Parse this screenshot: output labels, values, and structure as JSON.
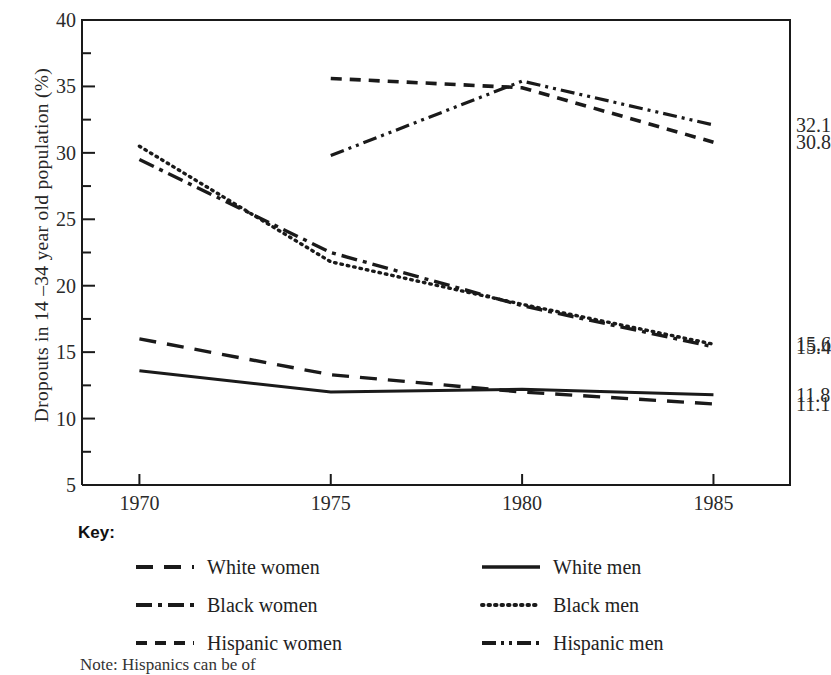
{
  "figure": {
    "ylabel": "Dropouts in 14 –34 year old population (%)",
    "key_title": "Key:",
    "footnote": "Note: Hispanics can be of"
  },
  "chart_data": {
    "type": "line",
    "title": "",
    "xlabel": "",
    "ylabel": "Dropouts in 14 –34 year old population (%)",
    "x": [
      1970,
      1975,
      1980,
      1985
    ],
    "xlim": [
      1968.5,
      1987.0
    ],
    "ylim": [
      5,
      40
    ],
    "xticks": [
      "1970",
      "1975",
      "1980",
      "1985"
    ],
    "yticks": [
      "5",
      "10",
      "15",
      "20",
      "25",
      "30",
      "35",
      "40"
    ],
    "y_minor_step": 2.5,
    "grid": false,
    "legend_position": "below-plot",
    "series": [
      {
        "name": "White women",
        "style": "dashed",
        "x": [
          1970,
          1975,
          1980,
          1985
        ],
        "values": [
          16.0,
          13.3,
          12.0,
          11.1
        ],
        "end_label": "11.1"
      },
      {
        "name": "White men",
        "style": "solid",
        "x": [
          1970,
          1975,
          1980,
          1985
        ],
        "values": [
          13.6,
          12.0,
          12.2,
          11.8
        ],
        "end_label": "11.8"
      },
      {
        "name": "Black women",
        "style": "dash-dot",
        "x": [
          1970,
          1975,
          1980,
          1985
        ],
        "values": [
          29.5,
          22.5,
          18.5,
          15.4
        ],
        "end_label": "15.4"
      },
      {
        "name": "Black men",
        "style": "dotted",
        "x": [
          1970,
          1975,
          1980,
          1985
        ],
        "values": [
          30.5,
          21.8,
          18.6,
          15.6
        ],
        "end_label": "15.6"
      },
      {
        "name": "Hispanic women",
        "style": "short-dash",
        "x": [
          1975,
          1980,
          1985
        ],
        "values": [
          35.6,
          34.9,
          30.8
        ],
        "end_label": "30.8"
      },
      {
        "name": "Hispanic men",
        "style": "dash-dot-dot",
        "x": [
          1975,
          1980,
          1985
        ],
        "values": [
          29.8,
          35.4,
          32.1
        ],
        "end_label": "32.1"
      }
    ]
  },
  "legend": {
    "left_column": [
      {
        "label": "White women",
        "style": "dashed"
      },
      {
        "label": "Black women",
        "style": "dash-dot"
      },
      {
        "label": "Hispanic women",
        "style": "short-dash"
      }
    ],
    "right_column": [
      {
        "label": "White men",
        "style": "solid"
      },
      {
        "label": "Black men",
        "style": "dotted"
      },
      {
        "label": "Hispanic men",
        "style": "dash-dot-dot"
      }
    ]
  },
  "colors": {
    "ink": "#1a1a1a",
    "background": "#ffffff"
  }
}
